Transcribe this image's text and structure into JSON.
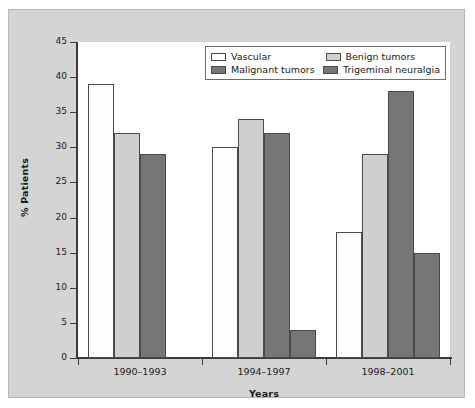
{
  "chart_data": {
    "type": "bar",
    "title": "",
    "subtitle": "",
    "xlabel": "Years",
    "ylabel": "% Patients",
    "categories": [
      "1990–1993",
      "1994–1997",
      "1998–2001"
    ],
    "series": [
      {
        "name": "Vascular",
        "values": [
          39,
          30,
          18
        ],
        "color": "#fdfdfd"
      },
      {
        "name": "Benign tumors",
        "values": [
          32,
          34,
          29
        ],
        "color": "#cfcfcf"
      },
      {
        "name": "Malignant tumors",
        "values": [
          29,
          32,
          38
        ],
        "color": "#767676"
      },
      {
        "name": "Trigeminal neuralgia",
        "values": [
          0,
          4,
          15
        ],
        "color": "#767676"
      }
    ],
    "ylim": [
      0,
      45
    ],
    "yticks": [
      0,
      5,
      10,
      15,
      20,
      25,
      30,
      35,
      40,
      45
    ],
    "ytick_labels": [
      "0",
      "5",
      "10",
      "15",
      "20",
      "25",
      "30",
      "35",
      "40",
      "45"
    ],
    "grid": false,
    "legend_position": "top-right",
    "legend_entries": [
      "Vascular",
      "Benign tumors",
      "Malignant tumors",
      "Trigeminal neuralgia"
    ]
  },
  "legend": {
    "rows": [
      {
        "left": {
          "label": "Vascular",
          "color": "#fdfdfd"
        },
        "right": {
          "label": "Benign tumors",
          "color": "#cfcfcf"
        }
      },
      {
        "left": {
          "label": "Malignant tumors",
          "color": "#767676"
        },
        "right": {
          "label": "Trigeminal neuralgia",
          "color": "#767676"
        }
      }
    ]
  },
  "axes": {
    "y_title": "% Patients",
    "x_title": "Years",
    "y_labels": [
      "45",
      "40",
      "35",
      "30",
      "25",
      "20",
      "15",
      "10",
      "5",
      "0"
    ],
    "x_labels": [
      "1990–1993",
      "1994–1997",
      "1998–2001"
    ]
  },
  "colors": {
    "panel_background": "#d4d4d4",
    "plot_background": "#ffffff",
    "axis": "#3a3a3a",
    "text": "#1b1b1b",
    "bar_outline": "#4a4a4a"
  }
}
